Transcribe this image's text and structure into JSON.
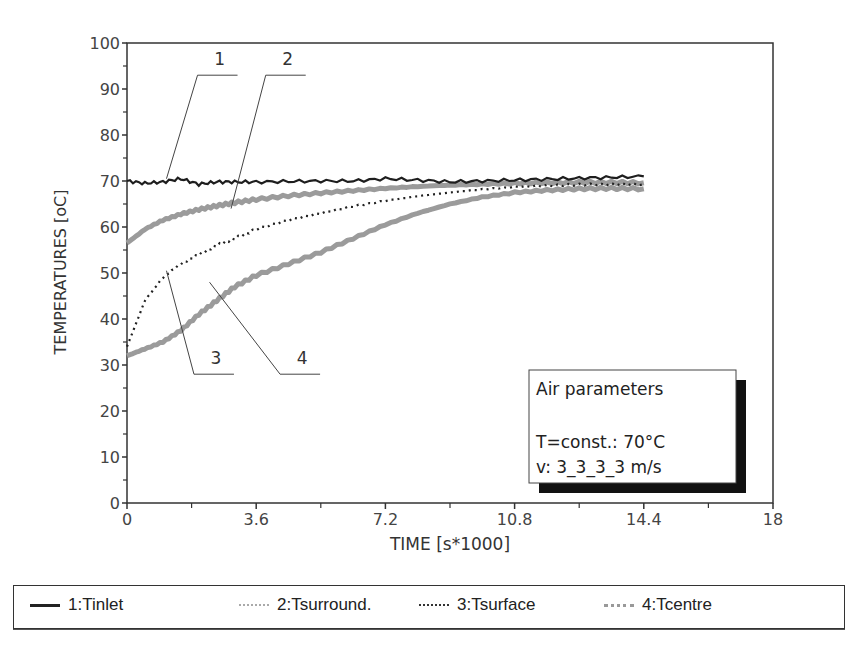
{
  "chart_data": {
    "type": "line",
    "title": "",
    "xlabel": "TIME [s*1000]",
    "ylabel": "TEMPERATURES [oC]",
    "xlim": [
      0,
      18
    ],
    "ylim": [
      0,
      100
    ],
    "xticks": [
      "0",
      "3.6",
      "7.2",
      "10.8",
      "14.4",
      "18"
    ],
    "yticks": [
      "0",
      "10",
      "20",
      "30",
      "40",
      "50",
      "60",
      "70",
      "80",
      "90",
      "100"
    ],
    "grid": false,
    "legend_position": "bottom",
    "x": [
      0,
      0.5,
      1,
      1.5,
      2,
      2.5,
      3,
      3.6,
      4.5,
      5.4,
      6.3,
      7.2,
      8.1,
      9,
      9.9,
      10.8,
      11.7,
      12.6,
      13.5,
      14.4
    ],
    "series": [
      {
        "name": "1:Tinlet",
        "label": "1",
        "style": "solid-dark",
        "values": [
          70,
          69.5,
          69.8,
          70.5,
          69.3,
          69.8,
          69.8,
          69.8,
          69.9,
          70.0,
          70.0,
          70.5,
          70.2,
          69.8,
          70.0,
          70.2,
          70.4,
          70.6,
          70.8,
          71.0
        ]
      },
      {
        "name": "2:Tsurround.",
        "label": "2",
        "style": "thick-gray",
        "values": [
          56.5,
          59.5,
          61.5,
          62.8,
          63.8,
          64.6,
          65.3,
          66.0,
          66.8,
          67.4,
          67.9,
          68.4,
          68.8,
          69.1,
          69.3,
          69.5,
          69.6,
          69.7,
          69.7,
          69.6
        ]
      },
      {
        "name": "3:Tsurface",
        "label": "3",
        "style": "dotted-dark",
        "values": [
          34,
          44,
          49,
          52,
          54,
          56,
          57.5,
          59.5,
          61.5,
          63,
          64.5,
          65.7,
          66.7,
          67.5,
          68.2,
          68.7,
          69,
          69.2,
          69.3,
          69.3
        ]
      },
      {
        "name": "4:Tcentre",
        "label": "4",
        "style": "thick-gray",
        "values": [
          32,
          33.5,
          35,
          37.5,
          41,
          44,
          47,
          49.5,
          52,
          54.5,
          57.5,
          60.5,
          63,
          65,
          66.5,
          67.5,
          68,
          68.3,
          68.4,
          68.3
        ]
      }
    ],
    "annotations": [
      {
        "text": "1",
        "leader_to": [
          1.1,
          70.5
        ],
        "label_at": [
          2.3,
          93
        ]
      },
      {
        "text": "2",
        "leader_to": [
          2.9,
          64
        ],
        "label_at": [
          4.2,
          93
        ]
      },
      {
        "text": "3",
        "leader_to": [
          1.1,
          50.5
        ],
        "label_at": [
          2.2,
          28
        ]
      },
      {
        "text": "4",
        "leader_to": [
          2.3,
          48
        ],
        "label_at": [
          4.6,
          28
        ]
      }
    ],
    "info_box": {
      "title": "Air parameters",
      "line1": "T=const.: 70°C",
      "line2": "v: 3_3_3_3 m/s"
    }
  },
  "legend": {
    "items": [
      {
        "label": "1:Tinlet"
      },
      {
        "label": "2:Tsurround."
      },
      {
        "label": "3:Tsurface"
      },
      {
        "label": "4:Tcentre"
      }
    ]
  },
  "colors": {
    "axis": "#333333",
    "dark_line": "#222222",
    "gray_line": "#9a9a9a",
    "text": "#333333"
  }
}
